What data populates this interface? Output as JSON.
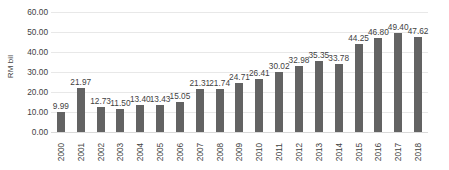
{
  "chart_data": {
    "type": "bar",
    "title": "",
    "xlabel": "",
    "ylabel": "RM bil",
    "ylim": [
      0,
      60
    ],
    "ytick_step": 10,
    "ytick_labels": [
      "0.00",
      "10.00",
      "20.00",
      "30.00",
      "40.00",
      "50.00",
      "60.00"
    ],
    "ytick_values": [
      0,
      10,
      20,
      30,
      40,
      50,
      60
    ],
    "grid": true,
    "legend": "none",
    "bar_color": "#636363",
    "gridline_color": "#e8e8e8",
    "text_color": "#3f3f3f",
    "categories": [
      "2000",
      "2001",
      "2002",
      "2003",
      "2004",
      "2005",
      "2006",
      "2007",
      "2008",
      "2009",
      "2010",
      "2011",
      "2012",
      "2013",
      "2014",
      "2015",
      "2016",
      "2017",
      "2018"
    ],
    "values": [
      9.99,
      21.97,
      12.73,
      11.5,
      13.4,
      13.43,
      15.05,
      21.31,
      21.74,
      24.71,
      26.41,
      30.02,
      32.98,
      35.35,
      33.78,
      44.25,
      46.8,
      49.4,
      47.62
    ],
    "data_labels": [
      "9.99",
      "21.97",
      "12.73",
      "11.50",
      "13.40",
      "13.43",
      "15.05",
      "21.31",
      "21.74",
      "24.71",
      "26.41",
      "30.02",
      "32.98",
      "35.35",
      "33.78",
      "44.25",
      "46.80",
      "49.40",
      "47.62"
    ]
  }
}
